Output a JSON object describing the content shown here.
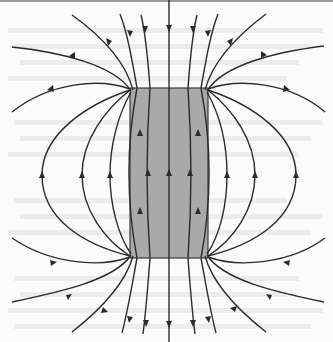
{
  "figure": {
    "colors": {
      "background": "#fbfbfb",
      "magnet_fill": "#a9a9a9",
      "magnet_stroke": "#3a3a3a",
      "field_line": "#2b2b2b",
      "bleed_text": "#ececec",
      "top_border": "#9a9a9a"
    },
    "magnet": {
      "x": 130,
      "y": 88,
      "width": 78,
      "height": 170
    },
    "bleed_text_rows": [
      28,
      44,
      60,
      76,
      120,
      136,
      152,
      198,
      214,
      230,
      276,
      292,
      308,
      324
    ]
  }
}
